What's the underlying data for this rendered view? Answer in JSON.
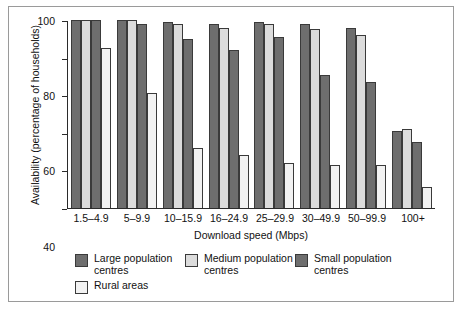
{
  "chart_data": {
    "type": "bar",
    "title": "",
    "subtitle": "",
    "xlabel": "Download speed (Mbps)",
    "ylabel": "Availability (percentage of households)",
    "ylim": [
      0,
      100
    ],
    "yticks": [
      0,
      20,
      40,
      60,
      80,
      100
    ],
    "ytick_labels": [
      "0",
      "20",
      "40",
      "60",
      "80",
      "100"
    ],
    "grid": false,
    "legend_position": "below-plot",
    "categories": [
      "1.5–4.9",
      "5–9.9",
      "10–15.9",
      "16–24.9",
      "25–29.9",
      "30–49.9",
      "50–99.9",
      "100+"
    ],
    "series": [
      {
        "name": "Large population centres",
        "color": "#6e6e6e",
        "values": [
          100,
          100,
          99,
          98,
          99,
          98,
          96,
          41
        ]
      },
      {
        "name": "Medium population centres",
        "color": "#dcdcdc",
        "values": [
          100,
          100,
          98,
          96,
          98,
          95,
          92,
          42
        ]
      },
      {
        "name": "Small population centres",
        "color": "#6e6e6e",
        "values": [
          100,
          98,
          90,
          84,
          91,
          71,
          67,
          35
        ]
      },
      {
        "name": "Rural areas",
        "color": "#f2f2f2",
        "values": [
          85,
          61,
          32,
          28,
          24,
          23,
          23,
          11
        ]
      }
    ]
  },
  "axes": {
    "y_title": "Availability (percentage of households)",
    "x_title": "Download speed (Mbps)"
  },
  "legend": {
    "items": [
      {
        "label": "Large population centres",
        "color": "#6e6e6e"
      },
      {
        "label": "Medium population centres",
        "color": "#dcdcdc"
      },
      {
        "label": "Small population centres",
        "color": "#6e6e6e"
      },
      {
        "label": "Rural areas",
        "color": "#f2f2f2"
      }
    ]
  }
}
